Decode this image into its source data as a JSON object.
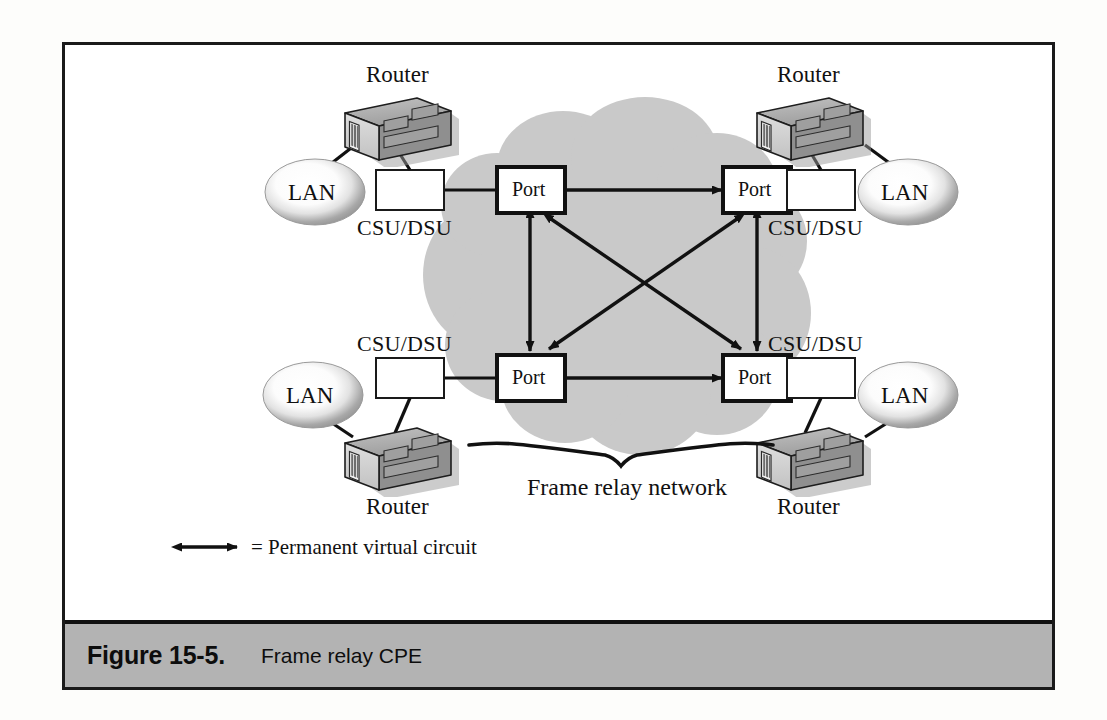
{
  "figure": {
    "caption_number": "Figure 15-5.",
    "caption_title": "Frame relay CPE"
  },
  "colors": {
    "cloud_fill": "#c9c9c9",
    "frame_border": "#1a1a1a",
    "caption_bar": "#b3b3b3",
    "page_background": "#fdfdfb",
    "line": "#111111",
    "router_top": "#b0b0b0",
    "router_front": "#d2d2d2",
    "router_side": "#8c8c8c"
  },
  "cloud": {
    "label": "Frame relay network"
  },
  "legend": {
    "text": "= Permanent virtual circuit",
    "symbol": "double-headed-arrow"
  },
  "ports": [
    {
      "id": "port-top-left",
      "label": "Port"
    },
    {
      "id": "port-top-right",
      "label": "Port"
    },
    {
      "id": "port-bottom-left",
      "label": "Port"
    },
    {
      "id": "port-bottom-right",
      "label": "Port"
    }
  ],
  "sites": [
    {
      "id": "site-top-left",
      "router_label": "Router",
      "csu_label": "CSU/DSU",
      "lan_label": "LAN"
    },
    {
      "id": "site-top-right",
      "router_label": "Router",
      "csu_label": "CSU/DSU",
      "lan_label": "LAN"
    },
    {
      "id": "site-bottom-left",
      "router_label": "Router",
      "csu_label": "CSU/DSU",
      "lan_label": "LAN"
    },
    {
      "id": "site-bottom-right",
      "router_label": "Router",
      "csu_label": "CSU/DSU",
      "lan_label": "LAN"
    }
  ],
  "pvc_links": [
    {
      "from": "port-top-left",
      "to": "port-top-right"
    },
    {
      "from": "port-bottom-left",
      "to": "port-bottom-right"
    },
    {
      "from": "port-top-left",
      "to": "port-bottom-left"
    },
    {
      "from": "port-top-right",
      "to": "port-bottom-right"
    },
    {
      "from": "port-top-left",
      "to": "port-bottom-right"
    },
    {
      "from": "port-top-right",
      "to": "port-bottom-left"
    }
  ]
}
